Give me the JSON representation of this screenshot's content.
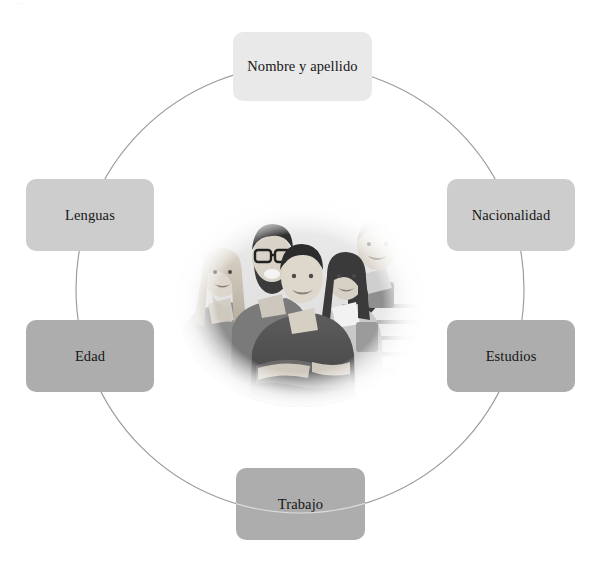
{
  "page": {
    "background_color": "#ffffff",
    "artifact_text": "····"
  },
  "diagram": {
    "type": "circular-cycle",
    "center_image": {
      "name": "group-of-young-people-photo",
      "description": "Fotografía en blanco y negro de cinco jóvenes sonriendo, con desvanecido ovalado",
      "people_count": 5,
      "style": "grayscale-oval-vignette"
    },
    "ring": {
      "center_x": 300,
      "center_y": 289,
      "radius": 224,
      "stroke_color": "#9a9a9a"
    },
    "nodes": [
      {
        "id": "nombre-y-apellido",
        "label": "Nombre y apellido",
        "position": "top",
        "fill": "#e9e9e9",
        "shade": "light"
      },
      {
        "id": "nacionalidad",
        "label": "Nacionalidad",
        "position": "right-upper",
        "fill": "#cdcdcd",
        "shade": "mid"
      },
      {
        "id": "estudios",
        "label": "Estudios",
        "position": "right-lower",
        "fill": "#adadad",
        "shade": "dark"
      },
      {
        "id": "trabajo",
        "label": "Trabajo",
        "position": "bottom",
        "fill": "#adadad",
        "shade": "dark"
      },
      {
        "id": "edad",
        "label": "Edad",
        "position": "left-lower",
        "fill": "#adadad",
        "shade": "dark"
      },
      {
        "id": "lenguas",
        "label": "Lenguas",
        "position": "left-upper",
        "fill": "#cdcdcd",
        "shade": "mid"
      }
    ]
  }
}
